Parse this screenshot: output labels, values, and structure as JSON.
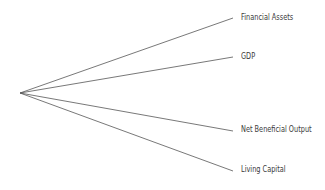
{
  "diagram": {
    "origin": {
      "x": 20,
      "y": 93
    },
    "line_color": "#555555",
    "branches": [
      {
        "label": "Financial Assets",
        "end": {
          "x": 233,
          "y": 18
        },
        "label_pos": {
          "x": 241,
          "y": 13
        }
      },
      {
        "label": "GDP",
        "end": {
          "x": 233,
          "y": 57
        },
        "label_pos": {
          "x": 241,
          "y": 52
        }
      },
      {
        "label": "Net Beneficial Output",
        "end": {
          "x": 233,
          "y": 131
        },
        "label_pos": {
          "x": 241,
          "y": 125
        }
      },
      {
        "label": "Living Capital",
        "end": {
          "x": 233,
          "y": 171
        },
        "label_pos": {
          "x": 241,
          "y": 165
        }
      }
    ]
  }
}
